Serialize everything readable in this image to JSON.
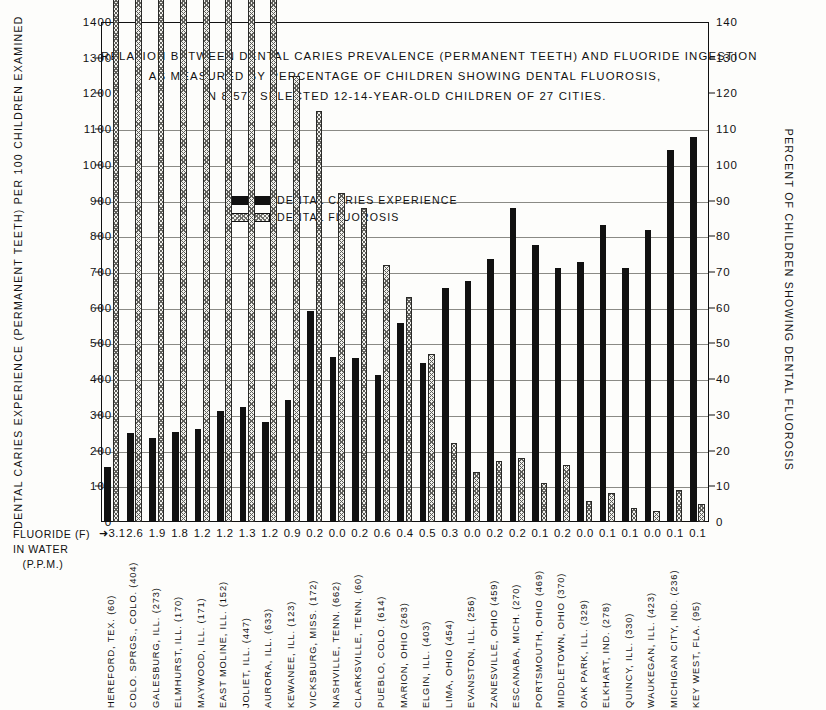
{
  "chart_data": {
    "type": "bar",
    "title_lines": [
      "RELATION BETWEEN DENTAL CARIES PREVALENCE (PERMANENT TEETH) AND FLUORIDE INGESTION",
      "AS MEASURED BY PERCENTAGE OF CHILDREN SHOWING DENTAL FLUOROSIS,",
      "IN 8,576 SELECTED 12-14-YEAR-OLD CHILDREN OF 27 CITIES."
    ],
    "xlabel": "FLUORIDE (F) IN WATER (P.P.M.)",
    "ylabel": "DENTAL CARIES EXPERIENCE (PERMANENT TEETH) PER 100 CHILDREN EXAMINED",
    "ylabel_right": "PERCENT OF CHILDREN SHOWING DENTAL FLUOROSIS",
    "ylim": [
      0,
      1400
    ],
    "ylim_right": [
      0,
      140
    ],
    "yticks": [
      0,
      100,
      200,
      300,
      400,
      500,
      600,
      700,
      800,
      900,
      1000,
      1100,
      1200,
      1300,
      1400
    ],
    "yticks_right": [
      0,
      10,
      20,
      30,
      40,
      50,
      60,
      70,
      80,
      90,
      100,
      110,
      120,
      130,
      140
    ],
    "gridlines": [
      100,
      200,
      300,
      400,
      500,
      600,
      700,
      800,
      900,
      1000,
      1100
    ],
    "grid": true,
    "legend_position": "inside-upper-center",
    "categories": [
      "HEREFORD, TEX. (60)",
      "COLO. SPRGS., COLO. (404)",
      "GALESBURG, ILL. (273)",
      "ELMHURST, ILL. (170)",
      "MAYWOOD, ILL. (171)",
      "EAST MOLINE, ILL. (152)",
      "JOLIET, ILL. (447)",
      "AURORA, ILL. (633)",
      "KEWANEE, ILL. (123)",
      "VICKSBURG, MISS. (172)",
      "NASHVILLE, TENN. (662)",
      "CLARKSVILLE, TENN. (60)",
      "PUEBLO, COLO. (614)",
      "MARION, OHIO (263)",
      "ELGIN, ILL. (403)",
      "LIMA, OHIO (454)",
      "EVANSTON, ILL. (256)",
      "ZANESVILLE, OHIO (459)",
      "ESCANABA, MICH. (270)",
      "PORTSMOUTH, OHIO (469)",
      "MIDDLETOWN, OHIO (370)",
      "OAK PARK, ILL. (329)",
      "ELKHART, IND. (278)",
      "QUINCY, ILL. (330)",
      "WAUKEGAN, ILL. (423)",
      "MICHIGAN CITY, IND. (236)",
      "KEY WEST, FLA. (95)"
    ],
    "fluoride_ppm": [
      "3.1",
      "2.6",
      "1.9",
      "1.8",
      "1.2",
      "1.2",
      "1.3",
      "1.2",
      "0.9",
      "0.2",
      "0.0",
      "0.2",
      "0.6",
      "0.4",
      "0.5",
      "0.3",
      "0.0",
      "0.2",
      "0.2",
      "0.1",
      "0.2",
      "0.0",
      "0.1",
      "0.1",
      "0.0",
      "0.1",
      "0.1"
    ],
    "fluoride_first_prefix": "➜",
    "series": [
      {
        "name": "DENTAL CARIES EXPERIENCE",
        "color": "#111111",
        "values": [
          155,
          248,
          236,
          253,
          260,
          310,
          322,
          281,
          343,
          591,
          463,
          459,
          413,
          558,
          446,
          655,
          676,
          737,
          878,
          775,
          712,
          727,
          832,
          712,
          817,
          1043,
          1078
        ]
      },
      {
        "name": "DENTAL FLUOROSIS",
        "color": "#f0f0ec",
        "values": [
          1000,
          740,
          477,
          400,
          334,
          306,
          249,
          152,
          125,
          115,
          92,
          88,
          72,
          63,
          47,
          22,
          14,
          17,
          18,
          11,
          16,
          6,
          8,
          4,
          3,
          9,
          5
        ]
      }
    ]
  },
  "legend": {
    "items": [
      {
        "label": "DENTAL CARIES EXPERIENCE",
        "swatch": "caries"
      },
      {
        "label": "DENTAL FLUOROSIS",
        "swatch": "fluorosis"
      }
    ]
  },
  "axis_labels": {
    "fluoride_line1": "FLUORIDE (F)",
    "fluoride_line2": "IN WATER",
    "fluoride_line3": "(P.P.M.)"
  }
}
